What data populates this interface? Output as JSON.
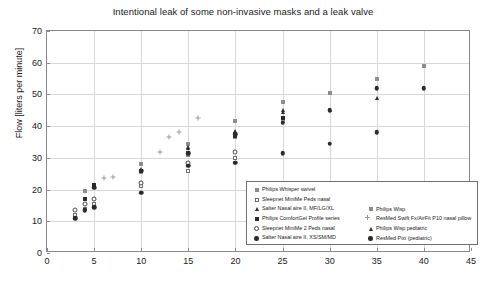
{
  "chart_data": {
    "type": "scatter",
    "title": "Intentional leak of some non-invasive masks and a leak valve",
    "xlabel": "",
    "ylabel": "Flow [liters per minute]",
    "xlim": [
      0,
      45
    ],
    "ylim": [
      0,
      70
    ],
    "xticks": [
      0,
      5,
      10,
      15,
      20,
      25,
      30,
      35,
      40,
      45
    ],
    "yticks": [
      0,
      10,
      20,
      30,
      40,
      50,
      60,
      70
    ],
    "grid": true,
    "legend_position": "lower-right",
    "series": [
      {
        "name": "Philips Whisper swivel",
        "marker": "square-filled-light",
        "points": [
          [
            4,
            19.5
          ],
          [
            5,
            21.5
          ],
          [
            10,
            25.5
          ],
          [
            15,
            31.0
          ],
          [
            20,
            36.5
          ],
          [
            25,
            41.5
          ]
        ]
      },
      {
        "name": "Sleepnet MiniMe Peds nasal",
        "marker": "square-open",
        "points": [
          [
            3,
            12.0
          ],
          [
            4,
            14.0
          ],
          [
            5,
            15.5
          ],
          [
            10,
            21.0
          ],
          [
            15,
            26.0
          ],
          [
            20,
            30.0
          ]
        ]
      },
      {
        "name": "Salter Nasal aire II, MF/LG/XL",
        "marker": "triangle-filled",
        "points": [
          [
            5,
            21.0
          ],
          [
            10,
            26.5
          ],
          [
            15,
            33.0
          ],
          [
            20,
            38.0
          ],
          [
            25,
            44.5
          ]
        ]
      },
      {
        "name": "Philips ComfortGel Profile series",
        "marker": "square-filled",
        "points": [
          [
            4,
            17.0
          ],
          [
            5,
            21.5
          ],
          [
            10,
            26.0
          ],
          [
            15,
            31.5
          ],
          [
            20,
            37.0
          ],
          [
            25,
            42.5
          ]
        ]
      },
      {
        "name": "Sleepnet MiniMe 2 Peds nasal",
        "marker": "circle-open",
        "points": [
          [
            3,
            13.5
          ],
          [
            4,
            15.5
          ],
          [
            5,
            17.0
          ],
          [
            10,
            22.0
          ],
          [
            15,
            28.5
          ],
          [
            20,
            32.0
          ]
        ]
      },
      {
        "name": "Salter Nasal aire II, XS/SM/MD",
        "marker": "circle-filled",
        "points": [
          [
            3,
            11.0
          ],
          [
            4,
            13.5
          ],
          [
            5,
            14.5
          ],
          [
            10,
            19.0
          ],
          [
            15,
            27.5
          ],
          [
            20,
            28.5
          ],
          [
            25,
            31.5
          ],
          [
            30,
            34.5
          ],
          [
            35,
            38.0
          ]
        ]
      },
      {
        "name": "Philips Wisp",
        "marker": "square-filled-light",
        "points": [
          [
            10,
            28.0
          ],
          [
            15,
            34.5
          ],
          [
            20,
            41.5
          ],
          [
            25,
            47.5
          ],
          [
            30,
            50.5
          ],
          [
            35,
            55.0
          ],
          [
            40,
            59.0
          ]
        ]
      },
      {
        "name": "ResMed Swift Fx/AirFit P10 nasal pillow",
        "marker": "plus",
        "points": [
          [
            6,
            23.5
          ],
          [
            7,
            24.0
          ],
          [
            12,
            32.0
          ],
          [
            13,
            36.5
          ],
          [
            14,
            38.0
          ],
          [
            16,
            42.5
          ]
        ]
      },
      {
        "name": "Philips Wisp pediatric",
        "marker": "triangle-filled",
        "points": [
          [
            15,
            33.5
          ],
          [
            20,
            38.5
          ],
          [
            25,
            45.0
          ],
          [
            30,
            45.0
          ],
          [
            35,
            49.0
          ]
        ]
      },
      {
        "name": "ResMed Pixi (pediatric)",
        "marker": "circle-filled",
        "points": [
          [
            5,
            20.5
          ],
          [
            10,
            26.0
          ],
          [
            15,
            31.5
          ],
          [
            20,
            37.5
          ],
          [
            25,
            41.0
          ],
          [
            30,
            45.0
          ],
          [
            35,
            52.0
          ],
          [
            40,
            52.0
          ]
        ]
      }
    ],
    "legend_columns": [
      [
        {
          "label": "Philips Whisper swivel",
          "marker": "square-filled-light"
        },
        {
          "label": "Sleepnet MiniMe Peds nasal",
          "marker": "square-open"
        },
        {
          "label": "Salter Nasal aire II, MF/LG/XL",
          "marker": "triangle-filled"
        },
        {
          "label": "Philips ComfortGel Profile series",
          "marker": "square-filled"
        },
        {
          "label": "Sleepnet MiniMe 2 Peds nasal",
          "marker": "circle-open"
        },
        {
          "label": "Salter Nasal aire II, XS/SM/MD",
          "marker": "circle-filled"
        }
      ],
      [
        {
          "label": "Philips Wisp",
          "marker": "square-filled-light"
        },
        {
          "label": "ResMed Swift Fx/AirFit P10 nasal pillow",
          "marker": "plus"
        },
        {
          "label": "Philips Wisp pediatric",
          "marker": "triangle-filled"
        },
        {
          "label": "ResMed Pixi (pediatric)",
          "marker": "circle-filled"
        }
      ]
    ]
  },
  "colors": {
    "axis": "#8a8a8a",
    "grid": "#d8d8d8",
    "marker_dark": "#2b2b2b",
    "marker_light": "#8d8d8d",
    "text": "#1a1a1a",
    "background": "#ffffff"
  }
}
